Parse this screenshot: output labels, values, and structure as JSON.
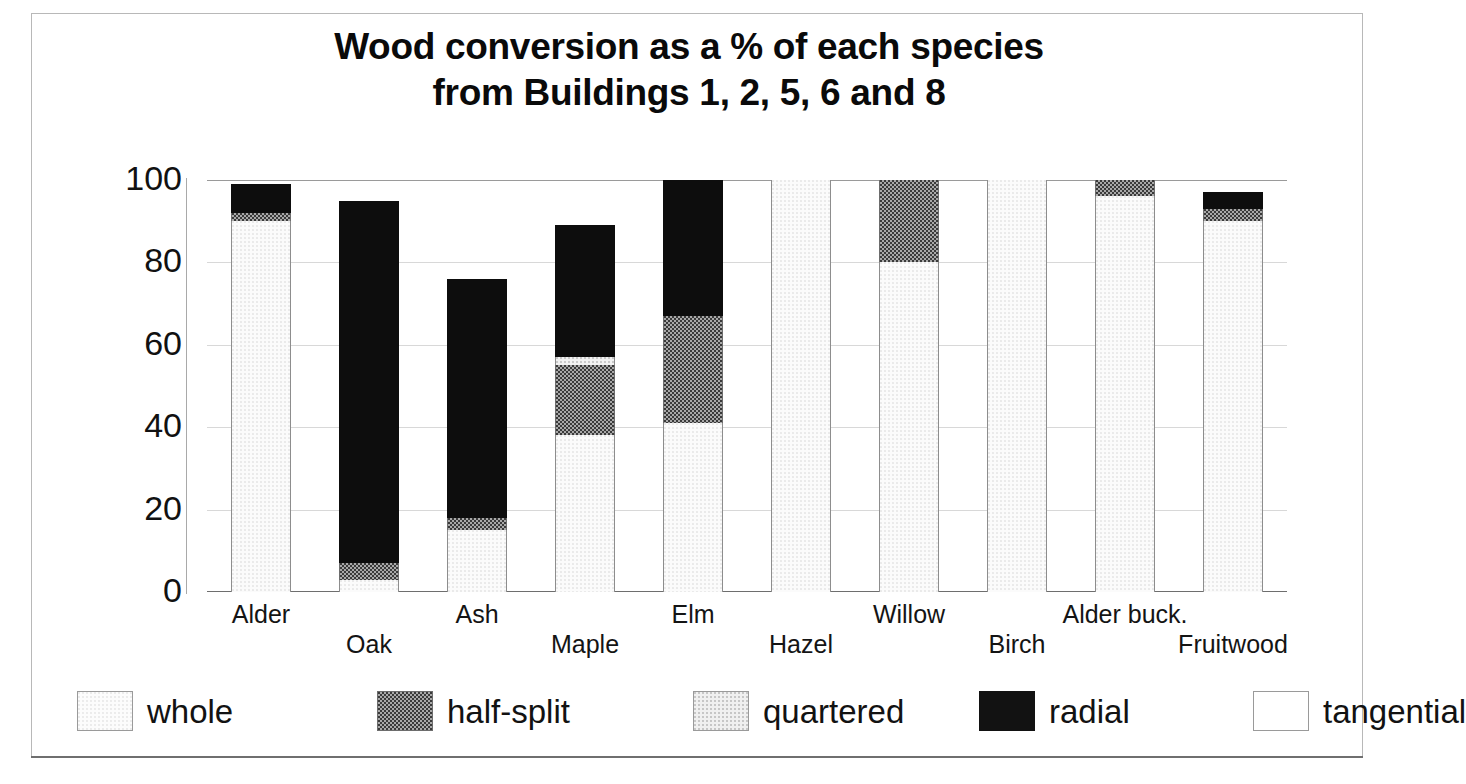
{
  "chart_data": {
    "type": "bar",
    "title": "Wood conversion as a % of each species\nfrom Buildings 1, 2, 5, 6 and 8",
    "xlabel": "",
    "ylabel": "",
    "ylim": [
      0,
      100
    ],
    "yticks": [
      0,
      20,
      40,
      60,
      80,
      100
    ],
    "ytick_labels": [
      "0",
      "20",
      "40",
      "60",
      "80",
      "100"
    ],
    "grid": true,
    "stacked": true,
    "legend_position": "bottom",
    "categories": [
      "Alder",
      "Oak",
      "Ash",
      "Maple",
      "Elm",
      "Hazel",
      "Willow",
      "Birch",
      "Alder buck.",
      "Fruitwood"
    ],
    "series": [
      {
        "name": "whole",
        "color": "#fbfbfb",
        "values": [
          90,
          3,
          15,
          38,
          41,
          100,
          80,
          100,
          96,
          90
        ]
      },
      {
        "name": "half-split",
        "color": "#a8a8a8",
        "values": [
          2,
          4,
          3,
          17,
          26,
          0,
          20,
          0,
          4,
          3
        ]
      },
      {
        "name": "quartered",
        "color": "#f2f2f2",
        "values": [
          0,
          0,
          0,
          2,
          0,
          0,
          0,
          0,
          0,
          0
        ]
      },
      {
        "name": "radial",
        "color": "#0d0d0d",
        "values": [
          7,
          88,
          58,
          32,
          33,
          0,
          0,
          0,
          0,
          4
        ]
      },
      {
        "name": "tangential",
        "color": "#ffffff",
        "values": [
          0,
          0,
          0,
          0,
          0,
          0,
          0,
          0,
          0,
          0
        ]
      }
    ],
    "totals": [
      99,
      95,
      76,
      89,
      100,
      100,
      100,
      100,
      100,
      97
    ]
  },
  "legend": {
    "items": [
      {
        "label": "whole",
        "swatch": "whole"
      },
      {
        "label": "half-split",
        "swatch": "halfsplit"
      },
      {
        "label": "quartered",
        "swatch": "quartered"
      },
      {
        "label": "radial",
        "swatch": "radial"
      },
      {
        "label": "tangential",
        "swatch": "tangential"
      }
    ]
  }
}
